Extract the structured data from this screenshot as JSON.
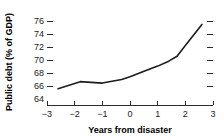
{
  "chart_data": {
    "type": "line",
    "title": "",
    "xlabel": "Years from disaster",
    "ylabel": "Public debt (% of GDP)",
    "xlim": [
      -3,
      3
    ],
    "ylim": [
      64,
      76.8
    ],
    "xticks": [
      -3,
      -2,
      -1,
      0,
      1,
      2,
      3
    ],
    "xticklabels": [
      "−3",
      "−2",
      "−1",
      "0",
      "1",
      "2",
      "3"
    ],
    "yticks": [
      64,
      66,
      68,
      70,
      72,
      74,
      76
    ],
    "yticklabels": [
      "64",
      "66",
      "68",
      "70",
      "72",
      "74",
      "76"
    ],
    "grid": false,
    "legend": false,
    "right_axis_ticks": true,
    "line_color": "#1c1c1c",
    "series": [
      {
        "name": "Public debt",
        "x": [
          -2.6,
          -1.8,
          -1.0,
          -0.3,
          0.0,
          0.6,
          1.0,
          1.4,
          1.7,
          2.0,
          2.6
        ],
        "values": [
          66.3,
          67.3,
          67.1,
          67.6,
          68.0,
          68.9,
          69.5,
          70.2,
          70.9,
          72.4,
          75.4
        ]
      }
    ]
  },
  "axis": {
    "y_title": "Public debt (% of GDP)",
    "x_title": "Years from disaster",
    "ytick_0": "64",
    "ytick_1": "66",
    "ytick_2": "68",
    "ytick_3": "70",
    "ytick_4": "72",
    "ytick_5": "74",
    "ytick_6": "76",
    "xtick_0": "−3",
    "xtick_1": "−2",
    "xtick_2": "−1",
    "xtick_3": "0",
    "xtick_4": "1",
    "xtick_5": "2",
    "xtick_6": "3"
  }
}
